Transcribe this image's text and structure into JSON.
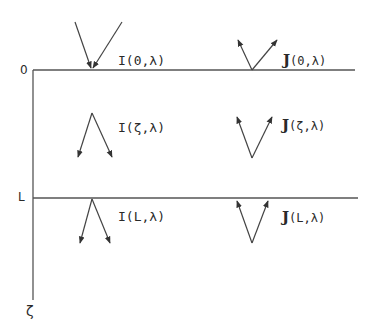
{
  "diagram": {
    "colors": {
      "line": "#555555",
      "text": "#2a2a2a",
      "background": "#ffffff"
    },
    "axis": {
      "top_label": "0",
      "boundary_label": "L",
      "depth_label": "ζ"
    },
    "labels": {
      "I_0": "I(0,λ)",
      "I_z": "I(ζ,λ)",
      "I_L": "I(L,λ)",
      "J_symbol": "J",
      "J_0_args": "(0,λ)",
      "J_z_args": "(ζ,λ)",
      "J_L_args": "(L,λ)"
    },
    "arrows": [
      {
        "name": "incoming-I-top",
        "direction": "down-converging",
        "position": "surface 0"
      },
      {
        "name": "outgoing-J-top",
        "direction": "up-diverging",
        "position": "surface 0"
      },
      {
        "name": "I-interior",
        "direction": "down-diverging",
        "position": "depth ζ"
      },
      {
        "name": "J-interior",
        "direction": "up-diverging",
        "position": "depth ζ"
      },
      {
        "name": "I-bottom",
        "direction": "down-diverging",
        "position": "depth L"
      },
      {
        "name": "J-bottom",
        "direction": "up-converging",
        "position": "depth L"
      }
    ]
  }
}
